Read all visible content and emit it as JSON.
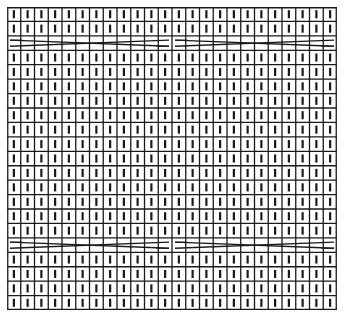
{
  "chart": {
    "type": "knitting-chart",
    "columns": 24,
    "rows": 21,
    "cell_width": 13.75,
    "cell_height": 14.43,
    "line_color": "#1a1a1a",
    "stitch_color": "#1a1a1a",
    "background": "#ffffff",
    "default_stitch": "knit-bar",
    "cable_rows": [
      {
        "row": 2,
        "cables": [
          {
            "start_col": 0,
            "end_col": 11,
            "type": "6-over-6-cross"
          },
          {
            "start_col": 12,
            "end_col": 23,
            "type": "6-over-6-cross"
          }
        ]
      },
      {
        "row": 16,
        "cables": [
          {
            "start_col": 0,
            "end_col": 11,
            "type": "6-over-6-cross"
          },
          {
            "start_col": 12,
            "end_col": 23,
            "type": "6-over-6-cross"
          }
        ]
      }
    ]
  }
}
